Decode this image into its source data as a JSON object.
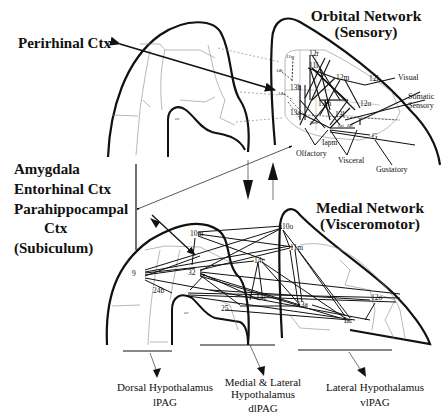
{
  "labels": {
    "perirhinal": "Perirhinal Ctx",
    "amygdala_block": [
      "Amygdala",
      "Entorhinal Ctx",
      "Parahippocampal",
      "Ctx",
      "(Subiculum)"
    ],
    "orbital_title": "Orbital Network",
    "orbital_subtitle": "(Sensory)",
    "medial_title": "Medial Network",
    "medial_subtitle": "(Visceromotor)",
    "inputs": {
      "visual": "Visual",
      "somatic1": "Somatic",
      "somatic2": "Sensory",
      "olfactory": "Olfactory",
      "visceral": "Visceral",
      "gustatory": "Gustatory"
    },
    "outputs": {
      "dorsal_hypo": "Dorsal Hypothalamus",
      "dorsal_pag": "lPAG",
      "medlat_hypo1": "Medial & Lateral",
      "medlat_hypo2": "Hypothalamus",
      "medlat_pag": "dlPAG",
      "lat_hypo": "Lateral Hypothalamus",
      "lat_pag": "vlPAG"
    },
    "cc_top": "cc",
    "cc_bottom": "cc"
  },
  "orbital_nodes": [
    "11m",
    "12r",
    "11l",
    "12m",
    "12l",
    "13b",
    "13m",
    "12o",
    "13a",
    "13l",
    "Iam",
    "Iapm",
    "Iai",
    "Ial",
    "G",
    "14r",
    "14c"
  ],
  "medial_nodes": [
    "10m",
    "10o",
    "11m",
    "14r",
    "9",
    "32",
    "24b",
    "14c",
    "13a",
    "12o",
    "25",
    "Iai"
  ]
}
